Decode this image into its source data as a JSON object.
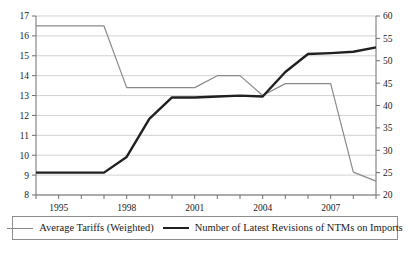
{
  "chart_data": {
    "type": "line",
    "title": "",
    "subtitle": "",
    "xlabel": "",
    "ylabel": "",
    "grid": true,
    "legend_position": "bottom",
    "x": [
      1994,
      1995,
      1996,
      1997,
      1998,
      1999,
      2000,
      2001,
      2002,
      2003,
      2004,
      2005,
      2006,
      2007,
      2008,
      2009
    ],
    "xlim": [
      1994,
      2009
    ],
    "x_tick_values": [
      1994,
      1995,
      1996,
      1997,
      1998,
      1999,
      2000,
      2001,
      2002,
      2003,
      2004,
      2005,
      2006,
      2007,
      2008,
      2009
    ],
    "x_tick_labels": [
      "1995",
      "1998",
      "2001",
      "2004",
      "2007"
    ],
    "x_labeled_values": [
      1995,
      1998,
      2001,
      2004,
      2007
    ],
    "left_axis": {
      "ylim": [
        8,
        17
      ],
      "ticks": [
        8,
        9,
        10,
        11,
        12,
        13,
        14,
        15,
        16,
        17
      ],
      "tick_labels": [
        "8",
        "9",
        "10",
        "11",
        "12",
        "13",
        "14",
        "15",
        "16",
        "17"
      ]
    },
    "right_axis": {
      "ylim": [
        20,
        60
      ],
      "ticks": [
        20,
        25,
        30,
        35,
        40,
        45,
        50,
        55,
        60
      ],
      "tick_labels": [
        "20",
        "25",
        "30",
        "35",
        "40",
        "45",
        "50",
        "55",
        "60"
      ]
    },
    "series": [
      {
        "name": "Average Tariffs (Weighted)",
        "axis": "left",
        "color": "#8a8a8a",
        "width": 1.2,
        "values": [
          16.5,
          16.5,
          16.5,
          16.5,
          13.4,
          13.4,
          13.4,
          13.4,
          14.0,
          14.0,
          13.0,
          13.6,
          13.6,
          13.6,
          9.15,
          8.7
        ]
      },
      {
        "name": "Number of Latest Revisions of NTMs on Imports",
        "axis": "right",
        "color": "#202020",
        "width": 2.4,
        "values": [
          25.0,
          25.0,
          25.0,
          25.0,
          28.5,
          37.0,
          41.8,
          41.8,
          42.0,
          42.2,
          42.0,
          47.5,
          51.5,
          51.7,
          52.0,
          53.0
        ]
      }
    ]
  },
  "legend": {
    "entries": [
      {
        "label": "Average Tariffs (Weighted)",
        "style": "thin"
      },
      {
        "label": "Number of Latest Revisions of NTMs on Imports",
        "style": "thick"
      }
    ]
  }
}
